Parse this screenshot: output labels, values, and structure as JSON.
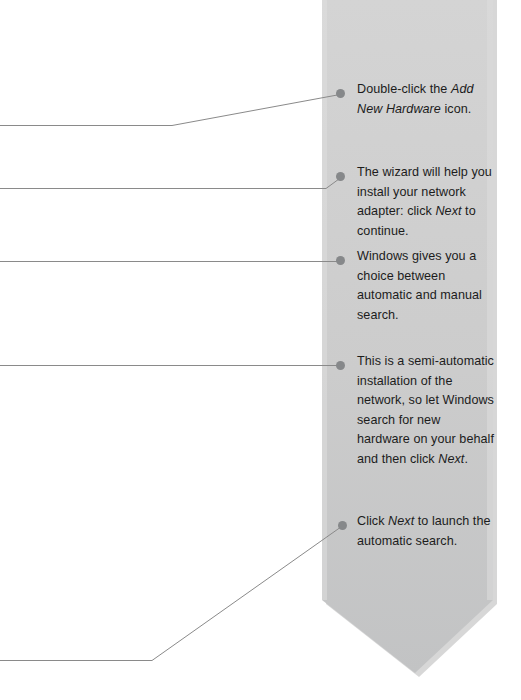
{
  "page": {
    "width": 521,
    "height": 700,
    "background": "#ffffff"
  },
  "banner": {
    "name": "annotation-ribbon",
    "fill_top": "#d3d3d3",
    "fill_bottom": "#c4c5c6",
    "edge_highlight": "#e3e3e3",
    "shadow": "#bdbdbd",
    "left_x": 322,
    "right_x": 493,
    "tip_x": 415,
    "tip_y": 673,
    "shoulder_y": 600
  },
  "marker": {
    "color": "#86888a",
    "diameter_px": 9
  },
  "leader": {
    "color": "#8a8a8a",
    "width_px": 1
  },
  "callouts": [
    {
      "id": "callout-add-new-hardware",
      "segments": [
        {
          "text": "Double-click the ",
          "italic": false
        },
        {
          "text": "Add New Hardware",
          "italic": true
        },
        {
          "text": " icon.",
          "italic": false
        }
      ],
      "plain": "Double-click the Add New Hardware icon."
    },
    {
      "id": "callout-wizard-help",
      "segments": [
        {
          "text": "The wizard will help you install your network adapter: click ",
          "italic": false
        },
        {
          "text": "Next",
          "italic": true
        },
        {
          "text": " to continue.",
          "italic": false
        }
      ],
      "plain": "The wizard will help you install your network adapter: click Next to continue."
    },
    {
      "id": "callout-automatic-manual-choice",
      "segments": [
        {
          "text": "Windows gives you a choice between automatic and manual search.",
          "italic": false
        }
      ],
      "plain": "Windows gives you a choice between automatic and manual search."
    },
    {
      "id": "callout-semi-automatic-install",
      "segments": [
        {
          "text": "This is a semi-automatic installation of the network, so let Windows search for new hardware on your behalf and then click ",
          "italic": false
        },
        {
          "text": "Next",
          "italic": true
        },
        {
          "text": ".",
          "italic": false
        }
      ],
      "plain": "This is a semi-automatic installation of the network, so let Windows search for new hardware on your behalf and then click Next."
    },
    {
      "id": "callout-launch-automatic-search",
      "segments": [
        {
          "text": "Click ",
          "italic": false
        },
        {
          "text": "Next",
          "italic": true
        },
        {
          "text": " to launch the automatic search.",
          "italic": false
        }
      ],
      "plain": "Click Next to launch the automatic search."
    }
  ],
  "leader_lines": [
    {
      "id": "leader-1",
      "path": "M 0 125.5 L 172 125.5 L 340 94.5"
    },
    {
      "id": "leader-2",
      "path": "M 0 188.5 L 326 188.5 L 341 177.5"
    },
    {
      "id": "leader-3",
      "path": "M 0 261.5 L 341 261.5"
    },
    {
      "id": "leader-4",
      "path": "M 0 365.5 L 341 365.5"
    },
    {
      "id": "leader-5",
      "path": "M 0 660.5 L 152 660.5 L 343 525.5"
    }
  ]
}
